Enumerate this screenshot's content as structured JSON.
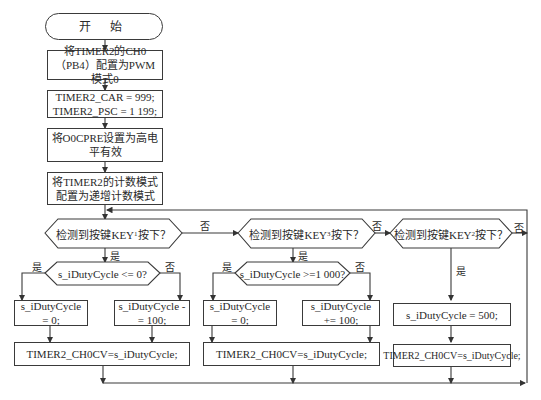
{
  "flowchart": {
    "start": "开 始",
    "steps": [
      "将TIMER2的CH0（PB4）配置为PWM模式0",
      "TIMER2_CAR = 999;\nTIMER2_PSC = 1 199;",
      "将O0CPRE设置为高电平有效",
      "将TIMER2的计数模式配置为递增计数模式"
    ],
    "decisions": [
      {
        "prefix": "检测到按键KEY",
        "sub": "1",
        "suffix": "按下？"
      },
      {
        "prefix": "检测到按键KEY",
        "sub": "3",
        "suffix": "按下？"
      },
      {
        "prefix": "检测到按键KEY",
        "sub": "2",
        "suffix": "按下？"
      }
    ],
    "inner_decisions": [
      "s_iDutyCycle <= 0?",
      "s_iDutyCycle >=1 000?"
    ],
    "assignments": {
      "b1_yes": "s_iDutyCycle = 0;",
      "b1_no": "s_iDutyCycle -= 100;",
      "b2_yes": "s_iDutyCycle = 0;",
      "b2_no": "s_iDutyCycle += 100;",
      "b3_yes": "s_iDutyCycle = 500;"
    },
    "cv_set": "TIMER2_CH0CV=s_iDutyCycle;",
    "labels": {
      "yes": "是",
      "no": "否"
    }
  }
}
